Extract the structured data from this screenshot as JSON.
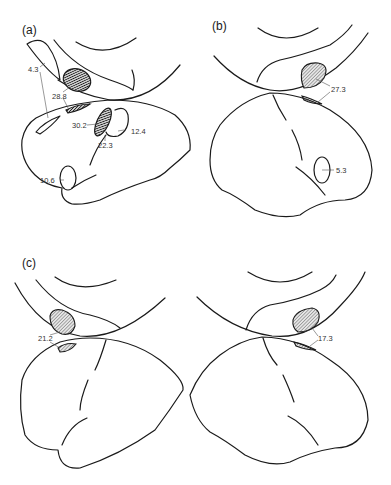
{
  "figure": {
    "panels": [
      {
        "id": "a",
        "label": "(a)",
        "values": [
          {
            "label": "4.3",
            "kind": "open"
          },
          {
            "label": "28.8",
            "kind": "dark-hatched"
          },
          {
            "label": "30.2",
            "kind": "dark-hatched"
          },
          {
            "label": "22.3",
            "kind": "open"
          },
          {
            "label": "12.4",
            "kind": "open"
          },
          {
            "label": "10.6",
            "kind": "open"
          }
        ]
      },
      {
        "id": "b",
        "label": "(b)",
        "values": [
          {
            "label": "27.3",
            "kind": "light-hatched"
          },
          {
            "label": "5.3",
            "kind": "open"
          }
        ]
      },
      {
        "id": "c",
        "label": "(c)",
        "values": [
          {
            "label": "21.2",
            "kind": "light-hatched"
          }
        ]
      },
      {
        "id": "c-right",
        "label": "",
        "values": [
          {
            "label": "17.3",
            "kind": "light-hatched"
          }
        ]
      }
    ]
  }
}
